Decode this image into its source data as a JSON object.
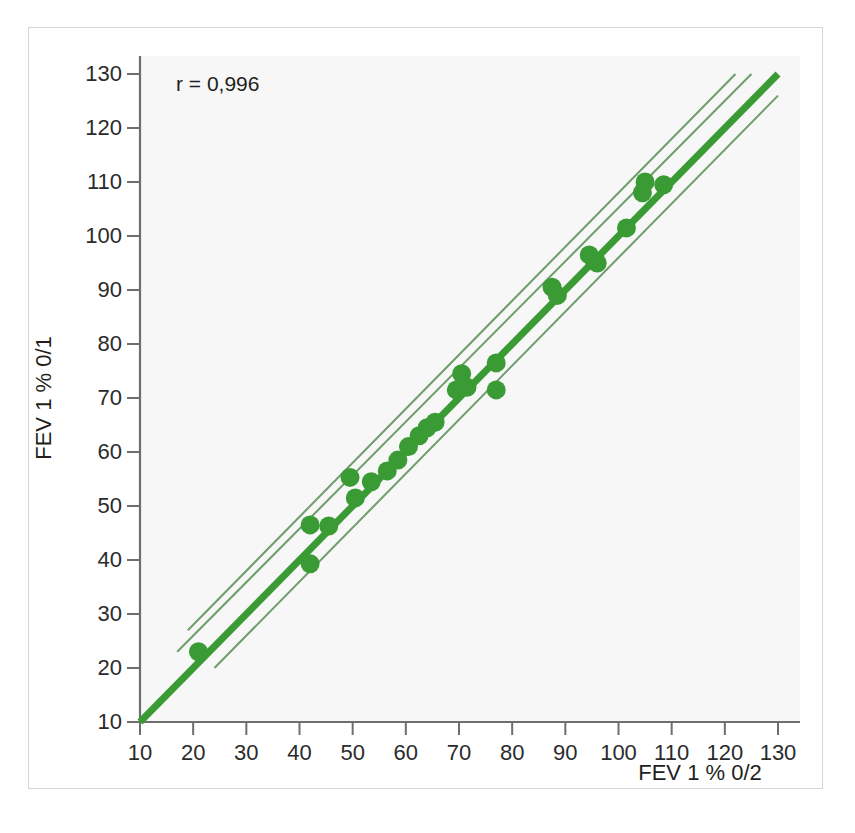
{
  "figure": {
    "background_color": "#ffffff",
    "frame_color": "#d6d6d6",
    "plot_bg_color": "#f7f7f7"
  },
  "annotation": {
    "correlation_text": "r = 0,996"
  },
  "axis_titles": {
    "x": "FEV 1 % 0/2",
    "y": "FEV 1 % 0/1"
  },
  "chart_data": {
    "type": "scatter",
    "title": "",
    "xlabel": "FEV 1 % 0/2",
    "ylabel": "FEV 1 % 0/1",
    "xlim": [
      10,
      130
    ],
    "ylim": [
      10,
      130
    ],
    "xticks": [
      10,
      20,
      30,
      40,
      50,
      60,
      70,
      80,
      90,
      100,
      110,
      120,
      130
    ],
    "yticks": [
      10,
      20,
      30,
      40,
      50,
      60,
      70,
      80,
      90,
      100,
      110,
      120,
      130
    ],
    "xticklabels": [
      "10",
      "20",
      "30",
      "40",
      "50",
      "60",
      "70",
      "80",
      "90",
      "100",
      "110",
      "120",
      "130"
    ],
    "yticklabels": [
      "10",
      "20",
      "30",
      "40",
      "50",
      "60",
      "70",
      "80",
      "90",
      "100",
      "110",
      "120",
      "130"
    ],
    "grid": false,
    "legend": null,
    "annotations": [
      {
        "text": "r = 0,996",
        "x": 23,
        "y": 126
      }
    ],
    "marker": {
      "color": "#3a9b35",
      "shape": "circle",
      "size_px": 19
    },
    "points": [
      {
        "x": 21.0,
        "y": 23.0
      },
      {
        "x": 42.0,
        "y": 46.5
      },
      {
        "x": 42.0,
        "y": 39.3
      },
      {
        "x": 45.5,
        "y": 46.3
      },
      {
        "x": 49.5,
        "y": 55.3
      },
      {
        "x": 50.5,
        "y": 51.5
      },
      {
        "x": 53.5,
        "y": 54.5
      },
      {
        "x": 56.5,
        "y": 56.5
      },
      {
        "x": 58.5,
        "y": 58.5
      },
      {
        "x": 60.5,
        "y": 61.0
      },
      {
        "x": 62.5,
        "y": 63.0
      },
      {
        "x": 64.0,
        "y": 64.5
      },
      {
        "x": 65.5,
        "y": 65.5
      },
      {
        "x": 69.5,
        "y": 71.5
      },
      {
        "x": 70.5,
        "y": 74.5
      },
      {
        "x": 71.5,
        "y": 72.0
      },
      {
        "x": 77.0,
        "y": 76.5
      },
      {
        "x": 77.0,
        "y": 71.5
      },
      {
        "x": 87.5,
        "y": 90.5
      },
      {
        "x": 88.5,
        "y": 89.0
      },
      {
        "x": 94.5,
        "y": 96.5
      },
      {
        "x": 95.5,
        "y": 95.3
      },
      {
        "x": 96.0,
        "y": 95.0
      },
      {
        "x": 101.5,
        "y": 101.5
      },
      {
        "x": 104.5,
        "y": 108.0
      },
      {
        "x": 105.0,
        "y": 110.0
      },
      {
        "x": 108.5,
        "y": 109.5
      }
    ],
    "regression_line": {
      "color": "#3a9b35",
      "width_px": 7,
      "x_start": 10,
      "y_start": 10,
      "x_end": 130,
      "y_end": 130
    },
    "confidence_bands": {
      "color": "#6d9d6a",
      "width_px": 2,
      "lines": [
        {
          "x_start": 19,
          "y_start": 27,
          "x_end": 122,
          "y_end": 130
        },
        {
          "x_start": 17,
          "y_start": 23,
          "x_end": 125,
          "y_end": 130
        },
        {
          "x_start": 22,
          "y_start": 22,
          "x_end": 129.5,
          "y_end": 129.5
        },
        {
          "x_start": 24,
          "y_start": 20,
          "x_end": 130,
          "y_end": 126
        }
      ]
    }
  }
}
